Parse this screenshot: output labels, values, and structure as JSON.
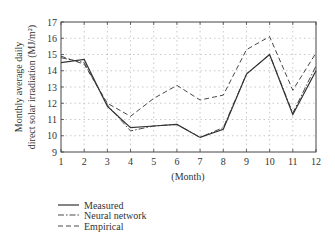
{
  "chart_data": {
    "type": "line",
    "title": "",
    "xlabel": "(Month)",
    "ylabel_line1": "Monthly average daily",
    "ylabel_line2": "direct solar irradiation (MJ/m²)",
    "x": [
      1,
      2,
      3,
      4,
      5,
      6,
      7,
      8,
      9,
      10,
      11,
      12
    ],
    "xlim": [
      1,
      12
    ],
    "ylim": [
      9,
      17
    ],
    "yticks": [
      9,
      10,
      11,
      12,
      13,
      14,
      15,
      16,
      17
    ],
    "xticks": [
      1,
      2,
      3,
      4,
      5,
      6,
      7,
      8,
      9,
      10,
      11,
      12
    ],
    "grid": true,
    "legend_position": "below",
    "series": [
      {
        "name": "Measured",
        "style": "solid",
        "values": [
          14.5,
          14.7,
          11.8,
          10.5,
          10.6,
          10.7,
          9.9,
          10.4,
          13.8,
          15.0,
          11.3,
          14.0
        ]
      },
      {
        "name": "Neural network",
        "style": "dashdot",
        "values": [
          14.8,
          14.5,
          11.9,
          10.3,
          10.6,
          10.7,
          9.9,
          10.5,
          13.8,
          15.0,
          11.4,
          14.3
        ]
      },
      {
        "name": "Empirical",
        "style": "dashed",
        "values": [
          14.9,
          14.4,
          12.0,
          11.2,
          12.3,
          13.1,
          12.2,
          12.5,
          15.3,
          16.1,
          12.8,
          15.1
        ]
      }
    ]
  },
  "colors": {
    "line": "#333333",
    "grid": "#bbbbbb",
    "axis": "#444444"
  }
}
